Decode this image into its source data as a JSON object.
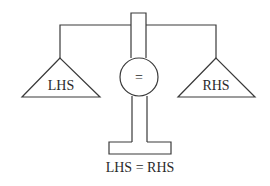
{
  "diagram": {
    "type": "balance-scale",
    "left_pan": {
      "label": "LHS"
    },
    "right_pan": {
      "label": "RHS"
    },
    "center": {
      "symbol": "="
    },
    "caption": "LHS = RHS",
    "colors": {
      "line": "#3a3a3a",
      "text": "#2a2a2a",
      "background": "#ffffff"
    }
  }
}
